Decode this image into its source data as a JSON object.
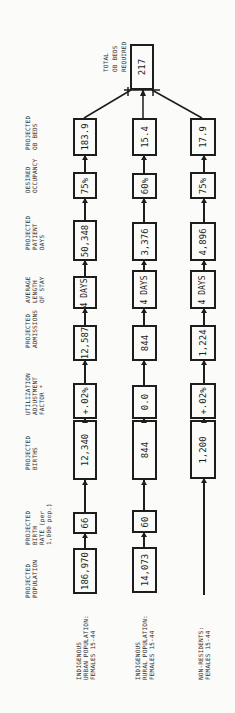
{
  "column_headers": [
    "PROJECTED\nPOPULATION",
    "PROJECTED\nBIRTH\nRATE (per\n1,000 pop.)",
    "PROJECTED\nBIRTHS",
    "UTILIZATION\nADJUSTMENT\nFACTOR *",
    "PROJECTED\nADMISSIONS",
    "AVERAGE\nLENGTH\nOF STAY",
    "PROJECTED\nPATIENT\nDAYS",
    "DESIRED\nOCCUPANCY",
    "PROJECTED\nOB BEDS"
  ],
  "rows": [
    {
      "label": "INDIGENOUS\nURBAN POPULATION:\nFEMALES 15-44",
      "population": "186,970",
      "birth_rate": "66",
      "births": "12,340",
      "adjustment": "+.02%",
      "admissions": "12,587",
      "length_of_stay": "4 DAYS",
      "patient_days": "50,348",
      "occupancy": "75%",
      "ob_beds": "183.9"
    },
    {
      "label": "INDIGENOUS\nRURAL POPULATION:\nFEMALES 15-44",
      "population": "14,073",
      "birth_rate": "60",
      "births": "844",
      "adjustment": "0.0",
      "admissions": "844",
      "length_of_stay": "4 DAYS",
      "patient_days": "3,376",
      "occupancy": "60%",
      "ob_beds": "15.4"
    },
    {
      "label": "NON-RESIDENTS:\nFEMALES 15-44",
      "population": "",
      "birth_rate": "",
      "births": "1,200",
      "adjustment": "+.02%",
      "admissions": "1,224",
      "length_of_stay": "4 DAYS",
      "patient_days": "4,896",
      "occupancy": "75%",
      "ob_beds": "17.9"
    }
  ],
  "total": {
    "label": "TOTAL\nOB BEDS\nREQUIRED",
    "value": "217"
  }
}
